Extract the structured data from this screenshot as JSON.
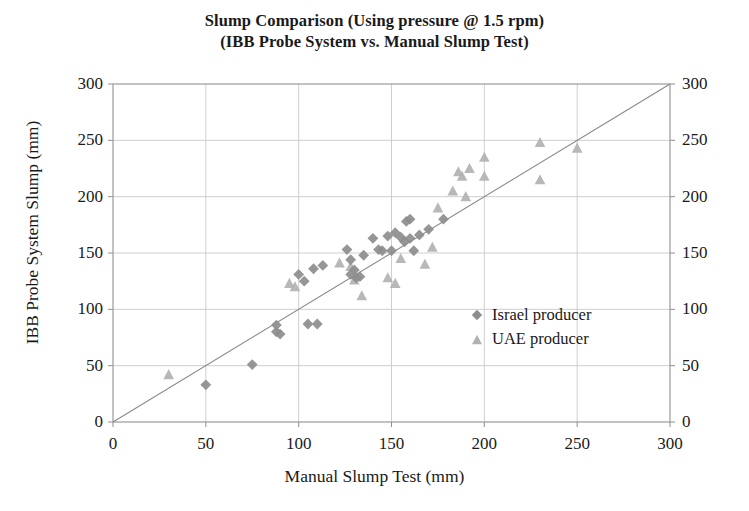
{
  "chart_data": {
    "type": "scatter",
    "title": "Slump Comparison (Using pressure @ 1.5 rpm)",
    "subtitle": "(IBB Probe System vs. Manual Slump Test)",
    "xlabel": "Manual Slump Test (mm)",
    "ylabel": "IBB Probe System Slump (mm)",
    "xlim": [
      0,
      300
    ],
    "ylim": [
      0,
      300
    ],
    "xticks": [
      0,
      50,
      100,
      150,
      200,
      250,
      300
    ],
    "yticks": [
      0,
      50,
      100,
      150,
      200,
      250,
      300
    ],
    "yticks_right": [
      0,
      50,
      100,
      150,
      200,
      250,
      300
    ],
    "grid": true,
    "legend_position": "inside-lower-right",
    "reference_line": {
      "name": "line of equality",
      "from": [
        0,
        0
      ],
      "to": [
        300,
        300
      ]
    },
    "series": [
      {
        "name": "Israel producer",
        "marker": "diamond",
        "color": "#8d8d8d",
        "points": [
          [
            50,
            33
          ],
          [
            75,
            51
          ],
          [
            88,
            80
          ],
          [
            88,
            86
          ],
          [
            90,
            78
          ],
          [
            105,
            87
          ],
          [
            110,
            87
          ],
          [
            100,
            131
          ],
          [
            103,
            125
          ],
          [
            108,
            136
          ],
          [
            113,
            139
          ],
          [
            126,
            153
          ],
          [
            128,
            144
          ],
          [
            128,
            131
          ],
          [
            130,
            135
          ],
          [
            131,
            128
          ],
          [
            133,
            129
          ],
          [
            135,
            148
          ],
          [
            140,
            163
          ],
          [
            143,
            153
          ],
          [
            145,
            152
          ],
          [
            148,
            165
          ],
          [
            150,
            152
          ],
          [
            152,
            168
          ],
          [
            155,
            164
          ],
          [
            157,
            160
          ],
          [
            158,
            178
          ],
          [
            160,
            180
          ],
          [
            160,
            163
          ],
          [
            162,
            152
          ],
          [
            165,
            166
          ],
          [
            170,
            171
          ],
          [
            178,
            180
          ]
        ]
      },
      {
        "name": "UAE producer",
        "marker": "triangle",
        "color": "#b2b2b2",
        "points": [
          [
            30,
            42
          ],
          [
            95,
            123
          ],
          [
            98,
            120
          ],
          [
            122,
            141
          ],
          [
            128,
            138
          ],
          [
            130,
            126
          ],
          [
            134,
            112
          ],
          [
            148,
            128
          ],
          [
            152,
            123
          ],
          [
            155,
            145
          ],
          [
            168,
            140
          ],
          [
            172,
            155
          ],
          [
            175,
            190
          ],
          [
            183,
            205
          ],
          [
            186,
            222
          ],
          [
            188,
            218
          ],
          [
            190,
            200
          ],
          [
            192,
            225
          ],
          [
            200,
            235
          ],
          [
            200,
            218
          ],
          [
            230,
            248
          ],
          [
            230,
            215
          ],
          [
            250,
            243
          ]
        ]
      }
    ]
  },
  "legend": {
    "items": [
      {
        "label": "Israel producer",
        "marker": "diamond",
        "color": "#8d8d8d"
      },
      {
        "label": "UAE producer",
        "marker": "triangle",
        "color": "#b2b2b2"
      }
    ]
  }
}
